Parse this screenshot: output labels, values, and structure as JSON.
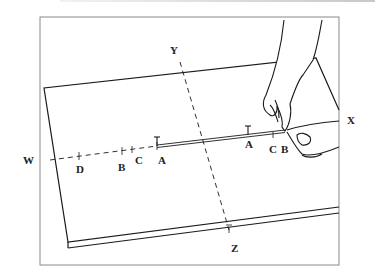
{
  "figure": {
    "axis_labels": {
      "top": "Y",
      "bottom": "Z",
      "left": "W",
      "right": "X"
    },
    "left_marks": [
      "D",
      "B",
      "C",
      "A"
    ],
    "right_marks": [
      "A",
      "C",
      "B"
    ],
    "colors": {
      "line": "#1a1a1a",
      "frame": "#8a8a8a",
      "background": "#ffffff"
    }
  }
}
